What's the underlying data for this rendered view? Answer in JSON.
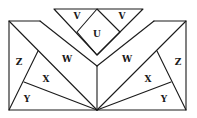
{
  "diagram": {
    "type": "geometric dissection figure",
    "labels": {
      "v_left": "V",
      "v_right": "V",
      "u": "U",
      "w_left": "W",
      "w_right": "W",
      "z_left": "Z",
      "z_right": "Z",
      "x_left": "X",
      "x_right": "X",
      "y_left": "Y",
      "y_right": "Y"
    },
    "regions": [
      "U",
      "V",
      "V",
      "W",
      "W",
      "X",
      "X",
      "Y",
      "Y",
      "Z",
      "Z"
    ],
    "stroke_color": "#1a1a1a",
    "background_color": "#ffffff"
  }
}
